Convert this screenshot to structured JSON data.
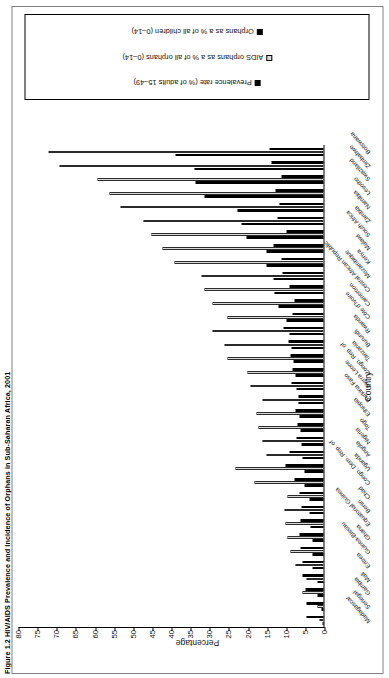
{
  "figure": {
    "caption": "Figure 1.2 HIV/AIDS Prevalence and Incidence of Orphans in Sub-Saharan Africa, 2001",
    "source": ""
  },
  "legend": {
    "items": [
      {
        "label": "Prevalence rate (% of adults 15–49)",
        "swatch": "black"
      },
      {
        "label": "AIDS orphans as a % of all orphans (0–14)",
        "swatch": "gray"
      },
      {
        "label": "Orphans as a % of all children (0–14)",
        "swatch": "black"
      }
    ]
  },
  "chart_data": {
    "type": "bar",
    "orientation": "vertical",
    "title": "Figure 1.2 HIV/AIDS Prevalence and Incidence of Orphans in Sub-Saharan Africa, 2001",
    "xlabel": "Country",
    "ylabel": "Percentage",
    "ylim": [
      0,
      80
    ],
    "yticks": [
      0,
      5,
      10,
      15,
      20,
      25,
      30,
      35,
      40,
      45,
      50,
      55,
      60,
      65,
      70,
      75,
      80
    ],
    "grid": false,
    "legend_position": "right",
    "categories": [
      "Madagascar",
      "Senegal",
      "Gambia",
      "Mali",
      "Eritrea",
      "Guinea-Bissau",
      "Ghana",
      "Equatorial Guinea",
      "Benin",
      "Chad",
      "Congo, Dem. Rep. of",
      "Uganda",
      "Angola",
      "Nigeria",
      "Togo",
      "Ethiopia",
      "Burkina Faso",
      "Sierra Leone",
      "Congo, Rep. of",
      "Tanzania",
      "Burundi",
      "Rwanda",
      "Côte d'Ivoire",
      "Cameroon",
      "Central African Republic",
      "Mozambique",
      "Kenya",
      "Malawi",
      "South Africa",
      "Zambia",
      "Namibia",
      "Lesotho",
      "Swaziland",
      "Zimbabwe",
      "Botswana"
    ],
    "series": [
      {
        "name": "Prevalence rate (% of adults 15–49)",
        "color": "#000000",
        "values": [
          0.3,
          0.5,
          1.6,
          1.7,
          2.8,
          2.8,
          3.0,
          3.4,
          3.6,
          3.6,
          4.9,
          5.0,
          5.5,
          5.8,
          6.0,
          6.4,
          6.5,
          7.0,
          7.2,
          7.8,
          8.3,
          8.9,
          9.7,
          11.8,
          12.9,
          13.0,
          15.0,
          15.0,
          20.1,
          21.5,
          22.5,
          31.0,
          33.4,
          33.7,
          38.8
        ]
      },
      {
        "name": "AIDS orphans as a % of all orphans (0–14)",
        "color": "#d9d9d9",
        "values": [
          1.0,
          1.7,
          5.6,
          4.4,
          7.2,
          8.6,
          9.5,
          10.0,
          10.3,
          9.4,
          18.0,
          23.0,
          15.0,
          16.0,
          17.0,
          17.5,
          16.0,
          19.0,
          20.0,
          25.0,
          26.0,
          29.0,
          25.0,
          29.0,
          31.0,
          32.0,
          39.0,
          42.0,
          45.0,
          47.0,
          53.0,
          56.0,
          59.0,
          69.0,
          72.0
        ]
      },
      {
        "name": "Orphans as a % of all children (0–14)",
        "color": "#000000",
        "values": [
          4.5,
          4.4,
          4.8,
          5.6,
          5.4,
          6.0,
          6.2,
          6.0,
          5.8,
          6.4,
          7.5,
          10.0,
          8.8,
          7.0,
          6.8,
          7.2,
          6.6,
          8.4,
          8.0,
          8.6,
          9.2,
          10.4,
          8.2,
          7.6,
          8.8,
          10.6,
          11.0,
          13.0,
          9.8,
          12.0,
          11.5,
          12.5,
          11.0,
          13.5,
          14.0
        ]
      }
    ]
  }
}
